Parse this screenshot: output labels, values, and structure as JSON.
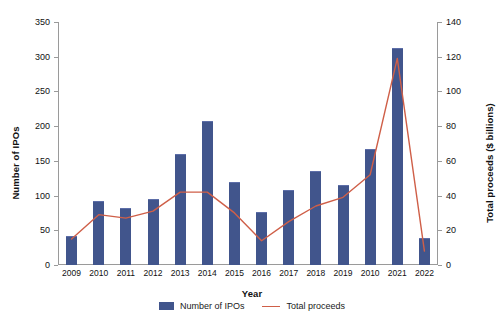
{
  "chart_data": {
    "type": "bar",
    "title": "",
    "subtitle": "",
    "xlabel": "Year",
    "ylabel": "Number of IPOs",
    "y2label": "Total proceeds ($ billions)",
    "categories": [
      "2009",
      "2010",
      "2011",
      "2012",
      "2013",
      "2014",
      "2015",
      "2016",
      "2017",
      "2018",
      "2019",
      "2010",
      "2021",
      "2022"
    ],
    "ylim": [
      0,
      350
    ],
    "yticks": [
      0,
      50,
      100,
      150,
      200,
      250,
      300,
      350
    ],
    "y2lim": [
      0,
      140
    ],
    "y2ticks": [
      0,
      20,
      40,
      60,
      80,
      100,
      120,
      140
    ],
    "grid": false,
    "legend_position": "bottom",
    "series": [
      {
        "name": "Number of IPOs",
        "kind": "bar",
        "axis": "left",
        "color": "#41558c",
        "values": [
          40,
          91,
          81,
          93,
          158,
          206,
          118,
          75,
          106,
          134,
          114,
          165,
          311,
          38
        ]
      },
      {
        "name": "Total proceeds",
        "kind": "line",
        "axis": "right",
        "color": "#cf5f48",
        "values": [
          15,
          29,
          27,
          31,
          42,
          42,
          30,
          14,
          25,
          34,
          39,
          52,
          119,
          8
        ]
      }
    ]
  },
  "legend": {
    "items": [
      {
        "label": "Number of IPOs",
        "marker": "bar-swatch",
        "color": "#41558c"
      },
      {
        "label": "Total proceeds",
        "marker": "line-swatch",
        "color": "#cf5f48"
      }
    ]
  }
}
